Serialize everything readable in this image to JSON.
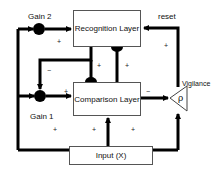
{
  "diagram": {
    "nodes": {
      "recognition_layer": "Recognition Layer",
      "comparison_layer": "Comparison Layer",
      "input": "Input (X)",
      "gain2": "Gain 2",
      "gain1": "Gain 1",
      "vigilance": "Vigilance",
      "rho": "ρ"
    },
    "edge_labels": {
      "reset": "reset",
      "plus": "+",
      "minus": "−"
    },
    "signs": {
      "gain2_to_recognition": "+",
      "recognition_to_gain1": "−",
      "recognition_to_comparison": "+",
      "comparison_to_recognition": "+",
      "gain1_to_comparison": "+",
      "comparison_to_vigilance": "−",
      "input_to_gain1": "+",
      "input_to_comparison": "+",
      "input_to_vigilance": "+",
      "reset_path": "+"
    },
    "colors": {
      "line": "#000000",
      "box_border": "#555555",
      "background": "#ffffff"
    }
  }
}
